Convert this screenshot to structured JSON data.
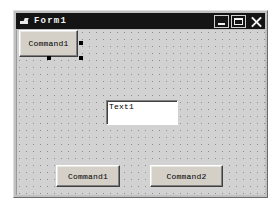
{
  "window": {
    "title": "Form1",
    "icon": "form-icon",
    "controls": [
      {
        "name": "minimize",
        "label": "_"
      },
      {
        "name": "maximize",
        "label": "□"
      },
      {
        "name": "close",
        "label": "×"
      }
    ],
    "titlebar_color": "#141414",
    "titlebar_text_color": "#f2f2f2",
    "body_color": "#c0c0c0",
    "surface_color": "#d2d2d2"
  },
  "design_surface": {
    "grid_dot_color": "#8c8c8c",
    "grid_spacing_px": 7
  },
  "controls": [
    {
      "id": "command1-top",
      "type": "CommandButton",
      "caption": "Command1",
      "selected": true
    },
    {
      "id": "text1",
      "type": "TextBox",
      "text": "Text1",
      "selected": false
    },
    {
      "id": "command1-bottom",
      "type": "CommandButton",
      "caption": "Command1",
      "selected": false
    },
    {
      "id": "command2-bottom",
      "type": "CommandButton",
      "caption": "Command2",
      "selected": false
    }
  ],
  "selection": {
    "handle_color": "#000000",
    "handles": [
      "middle-right",
      "bottom-right",
      "bottom-center"
    ]
  }
}
